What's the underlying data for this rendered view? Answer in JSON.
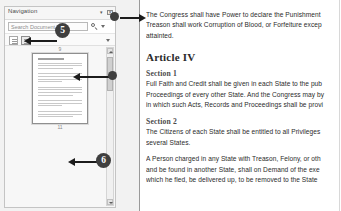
{
  "navigation_pane": {
    "title": "Navigation",
    "header_buttons": [
      {
        "name": "pane-options-button",
        "glyph": "▾"
      },
      {
        "name": "close-pane-button",
        "glyph": "✕"
      }
    ],
    "search": {
      "placeholder": "Search Document",
      "icon": "search-icon",
      "dropdown_icon": "chevron-down-icon"
    },
    "tabs": [
      {
        "name": "headings-tab",
        "label": ""
      },
      {
        "name": "pages-tab",
        "label": ""
      }
    ],
    "tabs_overflow_icon": "chevron-down-icon",
    "thumbnails": [
      {
        "page_number": "9",
        "selected": false
      },
      {
        "page_number": "10",
        "selected": true
      },
      {
        "page_number": "11",
        "selected": false
      }
    ],
    "scrollbar": {
      "up_icon": "chevron-up-icon",
      "down_icon": "chevron-down-icon"
    }
  },
  "document": {
    "blocks": [
      {
        "type": "paragraph",
        "lines": [
          "The Congress shall have Power to declare the Punishment",
          "Treason shall work Corruption of Blood, or Forfeiture excep",
          "attainted."
        ]
      },
      {
        "type": "heading1",
        "text": "Article IV"
      },
      {
        "type": "heading2",
        "text": "Section 1"
      },
      {
        "type": "paragraph",
        "lines": [
          "Full Faith and Credit shall be given in each State to the pub",
          "Proceedings of every other State. And the Congress may by",
          "in which such Acts, Records and Proceedings shall be provi"
        ]
      },
      {
        "type": "heading2",
        "text": "Section 2"
      },
      {
        "type": "paragraph",
        "lines": [
          "The Citizens of each State shall be entitled to all Privileges",
          "several States."
        ]
      },
      {
        "type": "paragraph",
        "lines": [
          "A Person charged in any State with Treason, Felony, or oth",
          "and be found in another State, shall on Demand of the exe",
          "which he fled, be delivered up, to be removed to the State"
        ]
      }
    ]
  },
  "annotations": {
    "badges": [
      {
        "name": "annotation-badge-5",
        "label": "5"
      },
      {
        "name": "annotation-badge-6",
        "label": "6"
      }
    ],
    "color": "#3f3f3f"
  }
}
